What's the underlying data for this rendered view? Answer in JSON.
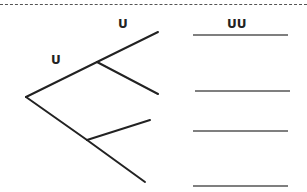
{
  "diagram": {
    "type": "tree-diagram",
    "labels": {
      "branch_top": "U",
      "branch_upper": "U",
      "answer_header": "UU"
    },
    "nodes": [
      {
        "id": "root",
        "x": 26,
        "y": 97
      },
      {
        "id": "upper",
        "x": 97,
        "y": 62
      },
      {
        "id": "lower",
        "x": 87,
        "y": 140
      }
    ],
    "edges": [
      {
        "from": [
          26,
          97
        ],
        "to": [
          97,
          62
        ]
      },
      {
        "from": [
          26,
          97
        ],
        "to": [
          87,
          140
        ]
      },
      {
        "from": [
          97,
          62
        ],
        "to": [
          158,
          32
        ]
      },
      {
        "from": [
          97,
          62
        ],
        "to": [
          158,
          94
        ]
      },
      {
        "from": [
          87,
          140
        ],
        "to": [
          150,
          120
        ]
      },
      {
        "from": [
          87,
          140
        ],
        "to": [
          145,
          182
        ]
      }
    ],
    "answer_lines": [
      {
        "x1": 193,
        "x2": 288,
        "y": 35
      },
      {
        "x1": 195,
        "x2": 290,
        "y": 91
      },
      {
        "x1": 193,
        "x2": 288,
        "y": 131
      },
      {
        "x1": 193,
        "x2": 288,
        "y": 186
      }
    ],
    "colors": {
      "line": "#222222",
      "answer_line": "#555555",
      "dashed_border": "#555555"
    }
  }
}
